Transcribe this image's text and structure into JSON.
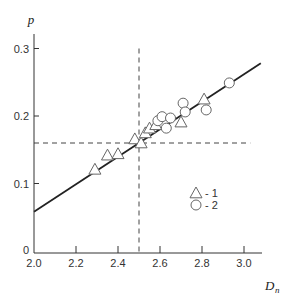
{
  "chart_data": {
    "type": "scatter",
    "title": "",
    "xlabel": "D",
    "xlabel_subscript": "n",
    "ylabel": "p",
    "xlim": [
      2.0,
      3.1
    ],
    "ylim": [
      0,
      0.32
    ],
    "x_ticks": [
      2.0,
      2.2,
      2.4,
      2.6,
      2.8,
      3.0
    ],
    "x_tick_labels": [
      "2.0",
      "2.2",
      "2.4",
      "2.6",
      "2.8",
      "3.0"
    ],
    "y_ticks": [
      0,
      0.1,
      0.2,
      0.3
    ],
    "y_tick_labels": [
      "0",
      "0.1",
      "0.2",
      "0.3"
    ],
    "grid": false,
    "legend_position": "inside-right",
    "series": [
      {
        "name": "1",
        "marker": "triangle",
        "points": [
          [
            2.29,
            0.121
          ],
          [
            2.35,
            0.142
          ],
          [
            2.4,
            0.144
          ],
          [
            2.48,
            0.166
          ],
          [
            2.51,
            0.16
          ],
          [
            2.53,
            0.175
          ],
          [
            2.55,
            0.182
          ],
          [
            2.58,
            0.187
          ],
          [
            2.7,
            0.191
          ],
          [
            2.81,
            0.225
          ]
        ]
      },
      {
        "name": "2",
        "marker": "circle",
        "points": [
          [
            2.59,
            0.193
          ],
          [
            2.61,
            0.199
          ],
          [
            2.63,
            0.182
          ],
          [
            2.65,
            0.197
          ],
          [
            2.71,
            0.219
          ],
          [
            2.72,
            0.206
          ],
          [
            2.82,
            0.209
          ],
          [
            2.93,
            0.249
          ]
        ]
      }
    ],
    "fit_line": {
      "x": [
        2.0,
        3.08
      ],
      "y": [
        0.058,
        0.278
      ]
    },
    "reference_lines": [
      {
        "orientation": "vertical",
        "x": 2.5,
        "y_range": [
          0,
          0.3
        ],
        "style": "dashed"
      },
      {
        "orientation": "horizontal",
        "y": 0.16,
        "x_range": [
          2.0,
          3.03
        ],
        "style": "dashed"
      }
    ],
    "legend": [
      {
        "marker": "triangle",
        "label": "- 1"
      },
      {
        "marker": "circle",
        "label": "- 2"
      }
    ],
    "colors": {
      "axis": "#333333",
      "line": "#222222",
      "marker_stroke": "#666666",
      "marker_fill": "#ffffff"
    }
  }
}
